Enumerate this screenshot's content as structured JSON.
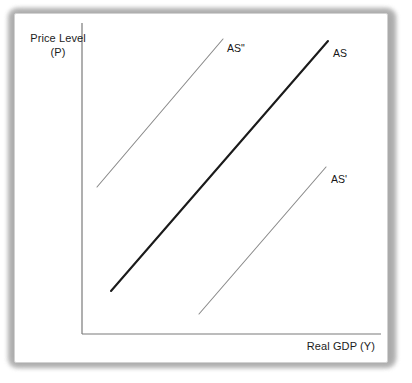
{
  "figure": {
    "type": "economics-diagram",
    "background_color": "#ffffff",
    "card_border_color": "#d2d2d2"
  },
  "axes": {
    "y_label_line1": "Price Level",
    "y_label_line2": "(P)",
    "x_label": "Real GDP (Y)",
    "axis_color": "#7a7a7a"
  },
  "curve_labels": {
    "as_double_prime": "AS\"",
    "as": "AS",
    "as_prime": "AS'"
  },
  "chart_data": {
    "type": "line",
    "title": "",
    "xlabel": "Real GDP (Y)",
    "ylabel": "Price Level (P)",
    "xlim": [
      0,
      100
    ],
    "ylim": [
      0,
      100
    ],
    "grid": false,
    "legend": "inline-end-labels",
    "axis_origin_px": [
      67,
      320
    ],
    "axis_x_end_px": [
      366,
      320
    ],
    "axis_y_top_px": [
      67,
      9
    ],
    "series": [
      {
        "name": "AS\"",
        "color": "#8a8a8a",
        "width_px": 1.1,
        "description": "Leftward-shifted aggregate supply curve (decrease in supply)",
        "points_px": [
          [
            82,
            173
          ],
          [
            208,
            25
          ]
        ],
        "x": [
          5,
          47
        ],
        "y": [
          42,
          87
        ]
      },
      {
        "name": "AS",
        "color": "#1b1b1b",
        "width_px": 2.1,
        "description": "Original aggregate supply curve",
        "points_px": [
          [
            96,
            277
          ],
          [
            313,
            27
          ]
        ],
        "x": [
          10,
          82
        ],
        "y": [
          13,
          86
        ]
      },
      {
        "name": "AS'",
        "color": "#8a8a8a",
        "width_px": 1.1,
        "description": "Rightward-shifted aggregate supply curve (increase in supply)",
        "points_px": [
          [
            184,
            300
          ],
          [
            311,
            153
          ]
        ],
        "x": [
          39,
          81
        ],
        "y": [
          6,
          49
        ]
      }
    ],
    "annotations": [
      {
        "text": "AS\"",
        "at_px": [
          212,
          29
        ],
        "anchor": "curve-end"
      },
      {
        "text": "AS",
        "at_px": [
          318,
          34
        ],
        "anchor": "curve-end"
      },
      {
        "text": "AS'",
        "at_px": [
          316,
          160
        ],
        "anchor": "curve-end"
      }
    ]
  }
}
